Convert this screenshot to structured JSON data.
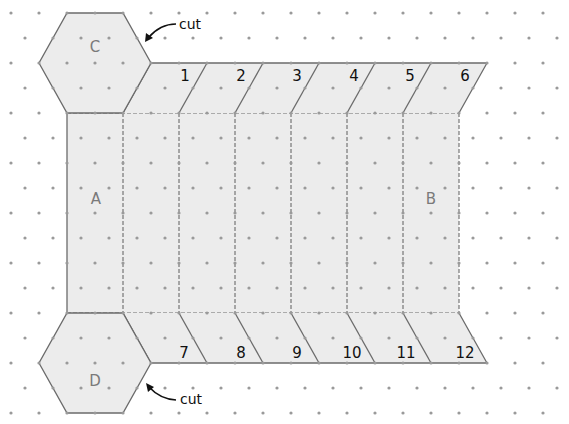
{
  "diagram": {
    "colors": {
      "fill": "#ececec",
      "outline": "#6b6b6b",
      "fold_line": "#6b6b6b",
      "dot": "#9a9a9a",
      "face_label": "#7a7a7a",
      "tab_label": "#111111"
    },
    "faces": {
      "C": "C",
      "D": "D",
      "A": "A",
      "B": "B"
    },
    "top_tabs": [
      "1",
      "2",
      "3",
      "4",
      "5",
      "6"
    ],
    "bottom_tabs": [
      "7",
      "8",
      "9",
      "10",
      "11",
      "12"
    ],
    "annotations": {
      "cut_top": "cut",
      "cut_bottom": "cut"
    }
  }
}
